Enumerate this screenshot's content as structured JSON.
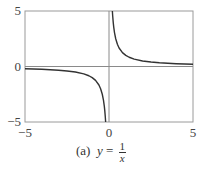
{
  "chart_data": {
    "type": "line",
    "title": "",
    "caption_label": "(a)",
    "caption_var": "y",
    "caption_eq": "=",
    "caption_num": "1",
    "caption_den": "x",
    "function": "y = 1/x",
    "xlabel": "",
    "ylabel": "",
    "xlim": [
      -5,
      5
    ],
    "ylim": [
      -5,
      5
    ],
    "x_ticks": [
      "-5",
      "0",
      "5"
    ],
    "y_ticks": [
      "5",
      "0",
      "-5"
    ],
    "grid": false,
    "reference_lines": {
      "x": 0,
      "y": 0
    },
    "series": [
      {
        "name": "y = 1/x (x<0)",
        "x": [
          -5,
          -4,
          -3,
          -2.5,
          -2,
          -1.5,
          -1.2,
          -1,
          -0.8,
          -0.6,
          -0.5,
          -0.4,
          -0.33,
          -0.28,
          -0.25,
          -0.22,
          -0.2
        ],
        "y": [
          -0.2,
          -0.25,
          -0.333,
          -0.4,
          -0.5,
          -0.667,
          -0.833,
          -1,
          -1.25,
          -1.667,
          -2,
          -2.5,
          -3.03,
          -3.57,
          -4,
          -4.55,
          -5
        ]
      },
      {
        "name": "y = 1/x (x>0)",
        "x": [
          0.2,
          0.22,
          0.25,
          0.28,
          0.33,
          0.4,
          0.5,
          0.6,
          0.8,
          1,
          1.2,
          1.5,
          2,
          2.5,
          3,
          4,
          5
        ],
        "y": [
          5,
          4.55,
          4,
          3.57,
          3.03,
          2.5,
          2,
          1.667,
          1.25,
          1,
          0.833,
          0.667,
          0.5,
          0.4,
          0.333,
          0.25,
          0.2
        ]
      }
    ],
    "colors": {
      "curve": "#333333",
      "frame": "#999999",
      "axis": "#888888"
    }
  },
  "caption": {
    "label": "(a)",
    "var": "y",
    "eq": "=",
    "num": "1",
    "den": "x"
  }
}
